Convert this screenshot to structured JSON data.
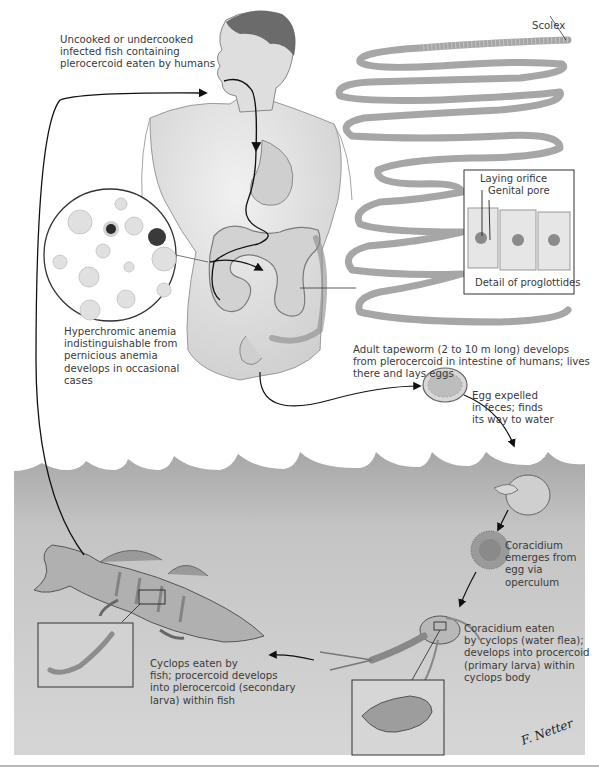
{
  "diagram": {
    "labels": {
      "ingestion": "Uncooked or undercooked\ninfected fish containing\nplerocercoid eaten by humans",
      "scolex": "Scolex",
      "laying_orifice": "Laying orifice",
      "genital_pore": "Genital pore",
      "proglottid_detail": "Detail of proglottides",
      "anemia": "Hyperchromic anemia\nindistinguishable from\npernicious anemia\ndevelops in occasional\ncases",
      "adult_tapeworm": "Adult tapeworm (2 to 10 m long) develops\nfrom plerocercoid in intestine of humans; lives\nthere and lays eggs",
      "egg": "Egg expelled\nin feces; finds\nits way to water",
      "coracidium": "Coracidium\nemerges from\negg via\noperculum",
      "cyclops": "Coracidium eaten\nby cyclops (water flea);\ndevelops into procercoid\n(primary larva) within\ncyclops body",
      "fish": "Cyclops eaten by\nfish; procercoid develops\ninto plerocercoid (secondary\nlarva) within fish",
      "signature": "F. Netter"
    },
    "stages": [
      {
        "id": "human",
        "name": "Human host (definitive)"
      },
      {
        "id": "egg",
        "name": "Egg in water"
      },
      {
        "id": "coracidium",
        "name": "Coracidium"
      },
      {
        "id": "cyclops",
        "name": "Cyclops (first intermediate host)"
      },
      {
        "id": "fish",
        "name": "Fish (second intermediate host)"
      }
    ],
    "colors": {
      "water": "#c9c9c9",
      "water_dark": "#a9a9a9",
      "ink": "#222222",
      "skin": "#e4e4e4",
      "worm": "#d8d8d8",
      "text": "#3a3a3a"
    }
  }
}
